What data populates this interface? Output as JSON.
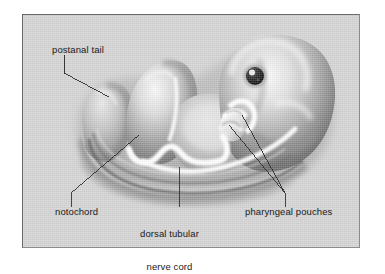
{
  "figure": {
    "kind": "biology-illustration",
    "panel_background": "#d5d5d5",
    "border_color": "#6a6a6a",
    "ink_color": "#1a1a1a"
  },
  "labels": {
    "postanal_tail": "postanal tail",
    "notochord": "notochord",
    "dorsal_nerve_cord_line1": "dorsal tubular",
    "dorsal_nerve_cord_line2": "nerve cord",
    "pharyngeal_pouches": "pharyngeal pouches"
  },
  "structures": {
    "tail": "postanal tail",
    "notochord": "notochord",
    "nerve_cord": "dorsal tubular nerve cord",
    "pouches": "pharyngeal pouches",
    "eye": "embryonic eye",
    "head": "head",
    "body": "body mass"
  }
}
